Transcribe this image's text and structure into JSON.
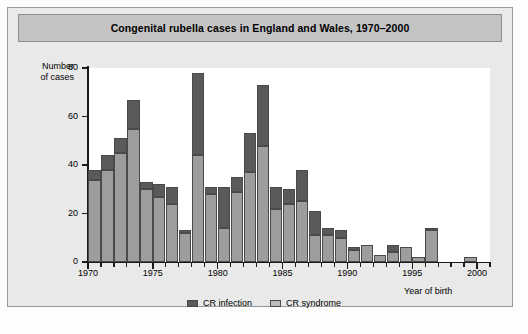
{
  "figure": {
    "title": "Congenital rubella cases in England and Wales, 1970–2000",
    "y_axis_title_line1": "Number",
    "y_axis_title_line2": "of cases",
    "x_axis_title": "Year of birth"
  },
  "legend": {
    "items": [
      {
        "label": "CR infection",
        "swatch": "dark-gray-swatch-icon",
        "color": "#5a5a5a"
      },
      {
        "label": "CR syndrome",
        "swatch": "light-gray-swatch-icon",
        "color": "#bcbcbc"
      }
    ]
  },
  "axes": {
    "y_ticks": [
      0,
      20,
      40,
      60,
      80
    ],
    "x_ticks_major": [
      1970,
      1975,
      1980,
      1985,
      1990,
      1995,
      2000
    ]
  },
  "chart_data": {
    "type": "bar",
    "stacked": true,
    "title": "Congenital rubella cases in England and Wales, 1970–2000",
    "xlabel": "Year of birth",
    "ylabel": "Number of cases",
    "ylim": [
      0,
      80
    ],
    "xlim": [
      1970,
      2001
    ],
    "grid": false,
    "legend_position": "bottom-center",
    "categories": [
      1970,
      1971,
      1972,
      1973,
      1974,
      1975,
      1976,
      1977,
      1978,
      1979,
      1980,
      1981,
      1982,
      1983,
      1984,
      1985,
      1986,
      1987,
      1988,
      1989,
      1990,
      1991,
      1992,
      1993,
      1994,
      1995,
      1996,
      1997,
      1998,
      1999,
      2000
    ],
    "series": [
      {
        "name": "CR syndrome",
        "color": "#9d9d9d",
        "values": [
          34,
          38,
          45,
          55,
          30,
          27,
          24,
          12,
          44,
          28,
          14,
          29,
          37,
          48,
          22,
          24,
          25,
          11,
          11,
          10,
          5,
          7,
          3,
          4,
          6,
          2,
          13,
          0,
          0,
          2,
          0
        ]
      },
      {
        "name": "CR infection",
        "color": "#5a5a5a",
        "values": [
          4,
          6,
          6,
          12,
          3,
          5,
          7,
          1,
          34,
          3,
          17,
          6,
          16,
          25,
          9,
          6,
          13,
          10,
          3,
          3,
          1,
          0,
          0,
          3,
          0,
          0,
          1,
          0,
          0,
          0,
          0
        ]
      }
    ],
    "totals": [
      38,
      44,
      51,
      67,
      33,
      32,
      31,
      13,
      78,
      31,
      31,
      35,
      53,
      73,
      31,
      30,
      38,
      21,
      14,
      13,
      6,
      7,
      3,
      7,
      6,
      2,
      14,
      0,
      0,
      2,
      0
    ]
  }
}
